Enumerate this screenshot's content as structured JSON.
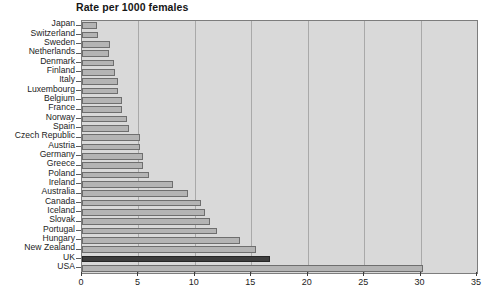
{
  "chart_data": {
    "type": "bar",
    "orientation": "horizontal",
    "title": "Rate per 1000 females",
    "xlabel": "",
    "ylabel": "",
    "xlim": [
      0,
      35
    ],
    "xticks": [
      0,
      5,
      10,
      15,
      20,
      25,
      30,
      35
    ],
    "grid": true,
    "legend": null,
    "categories": [
      "Japan",
      "Switzerland",
      "Sweden",
      "Netherlands",
      "Denmark",
      "Finland",
      "Italy",
      "Luxembourg",
      "Belgium",
      "France",
      "Norway",
      "Spain",
      "Czech Republic",
      "Austria",
      "Germany",
      "Greece",
      "Poland",
      "Ireland",
      "Australia",
      "Canada",
      "Iceland",
      "Slovak",
      "Portugal",
      "Hungary",
      "New Zealand",
      "UK",
      "USA"
    ],
    "values": [
      1.3,
      1.4,
      2.5,
      2.4,
      2.8,
      2.9,
      3.2,
      3.2,
      3.5,
      3.5,
      4.0,
      4.2,
      5.1,
      5.1,
      5.4,
      5.4,
      5.9,
      8.1,
      9.4,
      10.5,
      10.9,
      11.3,
      12.0,
      14.0,
      15.4,
      16.7,
      30.2
    ],
    "highlight_category": "UK",
    "colors": {
      "bar_fill": "#b4b4b4",
      "bar_edge": "#6e6e6e",
      "highlight_fill": "#3d3d3d",
      "highlight_edge": "#262626",
      "plot_background": "#d9d9d9",
      "page_background": "#ffffff",
      "gridline": "#a9a9a9",
      "axis": "#5d5d5d",
      "text": "#1c1c1c"
    }
  }
}
